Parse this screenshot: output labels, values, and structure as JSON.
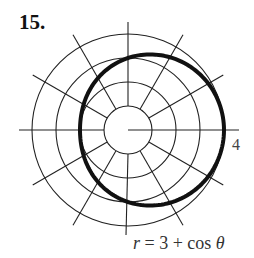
{
  "figure": {
    "problem_number": "15.",
    "tick_label": "4",
    "equation": {
      "lhs": "r",
      "op": " = 3 + cos ",
      "theta": "θ"
    }
  },
  "colors": {
    "grid": "#222222",
    "curve": "#111111",
    "background": "#ffffff"
  },
  "chart_data": {
    "type": "line",
    "coordinate_system": "polar",
    "title": "15.",
    "equation": "r = 3 + cos θ",
    "function": "r = 3 + cos(theta)",
    "grid": {
      "circles_r": [
        1,
        2,
        3,
        4
      ],
      "spoke_angles_deg": [
        30,
        60,
        120,
        150,
        210,
        240,
        300,
        330
      ],
      "axes_angles_deg": [
        0,
        90,
        180,
        270
      ]
    },
    "tick_labels": [
      {
        "r": 4,
        "theta_deg": 0,
        "label": "4"
      }
    ],
    "rlim": [
      0,
      4
    ],
    "series": [
      {
        "name": "r = 3 + cos θ",
        "theta_deg": [
          0,
          30,
          60,
          90,
          120,
          150,
          180,
          210,
          240,
          270,
          300,
          330,
          360
        ],
        "r": [
          4.0,
          3.87,
          3.5,
          3.0,
          2.5,
          2.13,
          2.0,
          2.13,
          2.5,
          3.0,
          3.5,
          3.87,
          4.0
        ]
      }
    ]
  }
}
